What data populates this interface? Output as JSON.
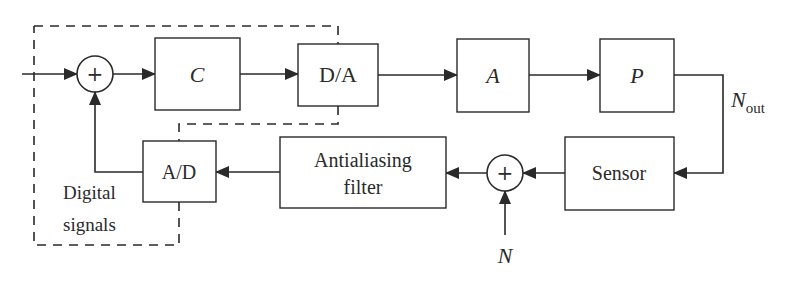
{
  "diagram": {
    "title": "",
    "colors": {
      "stroke": "#2a2a2a",
      "background": "#ffffff"
    },
    "blocks": {
      "controller": {
        "label": "C"
      },
      "dac": {
        "label": "D/A"
      },
      "amplifier": {
        "label": "A"
      },
      "plant": {
        "label": "P"
      },
      "sensor": {
        "label": "Sensor"
      },
      "filter": {
        "line1": "Antialiasing",
        "line2": "filter"
      },
      "adc": {
        "label": "A/D"
      }
    },
    "summing_junctions": [
      {
        "id": "sum-reference",
        "sign": "+"
      },
      {
        "id": "sum-noise",
        "sign": "+"
      }
    ],
    "signals": {
      "output": {
        "main": "N",
        "sub": "out"
      },
      "noise": "N"
    },
    "region": {
      "line1": "Digital",
      "line2": "signals"
    }
  }
}
